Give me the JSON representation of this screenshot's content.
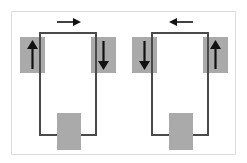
{
  "figure": {
    "background_color": "#ffffff",
    "frame_color": "#dcdcdc",
    "loop_color": "#4a4a4a",
    "shade_color": "#aaaaaa",
    "arrow_color": "#111111"
  },
  "panels": [
    {
      "id": "left-loop",
      "name": "left-current-loop",
      "circulation": "clockwise",
      "top_arrow": {
        "icon": "arrow-right-icon",
        "direction": "right",
        "glyph": "→",
        "label": ""
      },
      "left_arrow": {
        "icon": "arrow-up-icon",
        "direction": "up",
        "glyph": "↑",
        "label": ""
      },
      "right_arrow": {
        "icon": "arrow-down-icon",
        "direction": "down",
        "glyph": "↓",
        "label": ""
      },
      "left_shade": {
        "name": "left-field-region",
        "label": ""
      },
      "right_shade": {
        "name": "right-field-region",
        "label": ""
      },
      "bottom_block": {
        "name": "bottom-shaded-block",
        "label": ""
      }
    },
    {
      "id": "right-loop",
      "name": "right-current-loop",
      "circulation": "counter-clockwise",
      "top_arrow": {
        "icon": "arrow-left-icon",
        "direction": "left",
        "glyph": "←",
        "label": ""
      },
      "left_arrow": {
        "icon": "arrow-down-icon",
        "direction": "down",
        "glyph": "↓",
        "label": ""
      },
      "right_arrow": {
        "icon": "arrow-up-icon",
        "direction": "up",
        "glyph": "↑",
        "label": ""
      },
      "left_shade": {
        "name": "left-field-region",
        "label": ""
      },
      "right_shade": {
        "name": "right-field-region",
        "label": ""
      },
      "bottom_block": {
        "name": "bottom-shaded-block",
        "label": ""
      }
    }
  ]
}
